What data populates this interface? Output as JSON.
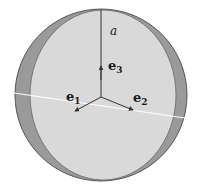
{
  "diagram": {
    "type": "sphere-with-basis-vectors",
    "colors": {
      "background": "#ffffff",
      "sphere_shade": "#9a9a9a",
      "sphere_face": "#d9d9d9",
      "outline": "#555555",
      "equator_line": "#ffffff",
      "axis": "#333333"
    },
    "labels": {
      "axis_label": "a",
      "e1_base": "e",
      "e1_sub": "1",
      "e2_base": "e",
      "e2_sub": "2",
      "e3_base": "e",
      "e3_sub": "3"
    },
    "icons": {
      "arrowhead": "arrow-head-icon"
    }
  }
}
